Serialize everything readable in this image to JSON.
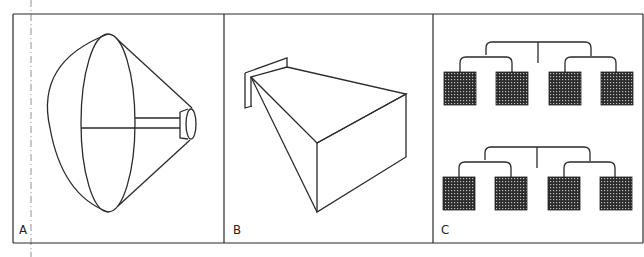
{
  "figure": {
    "panels": [
      {
        "id": "A",
        "label": "A",
        "subject": "parabolic-dish-antenna"
      },
      {
        "id": "B",
        "label": "B",
        "subject": "pyramidal-horn-antenna"
      },
      {
        "id": "C",
        "label": "C",
        "subject": "phased-array-feed-network"
      }
    ],
    "colors": {
      "line": "#2a2a2a",
      "background": "#ffffff",
      "element_fill": "#3a3a3a"
    }
  }
}
